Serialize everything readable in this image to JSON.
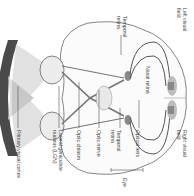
{
  "diagram": {
    "orientation": "rotated 90 degrees clockwise",
    "labels": {
      "left_visual_field": [
        "Left visual",
        "field"
      ],
      "right_visual_field": [
        "Right visual",
        "field"
      ],
      "temporal_retina_left": [
        "Temporal",
        "retina"
      ],
      "temporal_retina_right": [
        "Temporal",
        "retina"
      ],
      "nasal_retina": "Nasal retina",
      "optical_lens": "Optical lens",
      "eye": "Eye",
      "optic_nerve": "Optic nerve",
      "optic_chiasm": "Optic chiasm",
      "lgn": [
        "Lateral geniculate",
        "nucleus (LGN)"
      ],
      "primary_visual_cortex": "Primary visual cortex"
    },
    "colors": {
      "visual_field_arc": "#4a4a4a",
      "field_cone": "#d9d9d9",
      "field_overlap": "#c4c4c4",
      "outline": "#555555",
      "eyeball_fill": "#ececec",
      "nucleus_fill": "#888888",
      "cortex_fill": "#bdbdbd",
      "label_text": "#444444"
    }
  }
}
